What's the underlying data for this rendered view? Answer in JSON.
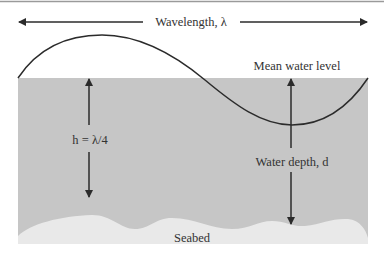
{
  "diagram": {
    "labels": {
      "wavelength": "Wavelength, λ",
      "mean_water_level": "Mean water level",
      "h_equation": "h = λ/4",
      "water_depth": "Water depth, d",
      "seabed": "Seabed"
    },
    "colors": {
      "background": "#ffffff",
      "water": "#c6c6c6",
      "seabed": "#e9e9e9",
      "line": "#2b2b2b",
      "top_rule": "#9a9a9a"
    }
  }
}
